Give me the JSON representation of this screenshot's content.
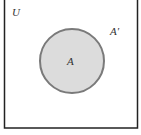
{
  "diagram": {
    "type": "venn",
    "universe_label": "U",
    "set_label": "A",
    "complement_label": "A′",
    "colors": {
      "border": "#222222",
      "circle_fill": "#dcdcdc",
      "circle_stroke": "#7a7a7a",
      "text": "#333333",
      "background": "#ffffff"
    }
  }
}
